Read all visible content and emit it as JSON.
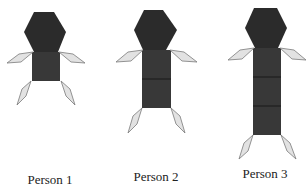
{
  "figure": {
    "colors": {
      "head": "#2b2b2b",
      "body": "#383838",
      "divider": "#111111",
      "limb_fill": "#e2e2e2",
      "limb_stroke": "#7a7a7a",
      "label": "#222222"
    },
    "people": [
      {
        "label": "Person 1",
        "squares": 1,
        "label_x": 50,
        "label_y": 170
      },
      {
        "label": "Person 2",
        "squares": 2,
        "label_x": 156,
        "label_y": 167
      },
      {
        "label": "Person 3",
        "squares": 3,
        "label_x": 265,
        "label_y": 165
      }
    ],
    "shapes": {
      "head": "hexagon",
      "body_segment": "square",
      "arms": "rhombus",
      "legs": "rhombus"
    }
  }
}
